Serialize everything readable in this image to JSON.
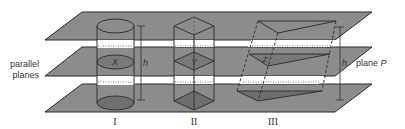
{
  "figure": {
    "labels": {
      "parallel_planes_line1": "parallel",
      "parallel_planes_line2": "planes",
      "plane_p": "plane ",
      "plane_p_italic": "P",
      "height": "h",
      "cross_section_x": "X",
      "cross_section_y": "Y",
      "cross_section_z": "Z",
      "solid_1": "I",
      "solid_2": "II",
      "solid_3": "III"
    },
    "colors": {
      "plane_fill": "#8c8c8c",
      "plane_edge": "#2a2a2a",
      "section_fill": "#7a7a7a",
      "base_fill": "#6e6e6e",
      "band_fill": "#ffffff",
      "line": "#333333"
    }
  }
}
